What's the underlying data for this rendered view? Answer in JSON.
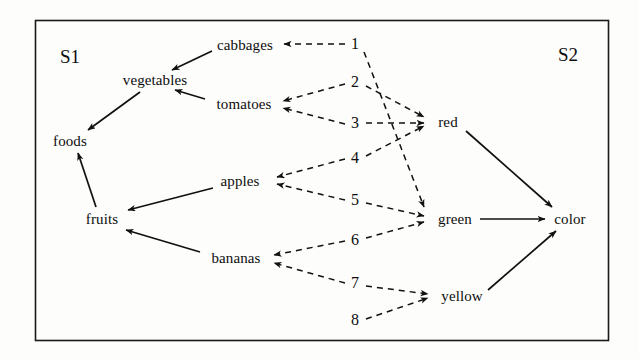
{
  "figure": {
    "type": "diagram",
    "kind": "bipartite-concept-lattice",
    "border_color": "#1a1a1a",
    "solid_edge_color": "#111111",
    "dashed_edge_color": "#111111",
    "background": "#fdfdfb"
  },
  "regions": {
    "left": {
      "label": "S1",
      "x": 70,
      "y": 57
    },
    "right": {
      "label": "S2",
      "x": 568,
      "y": 55
    }
  },
  "nodes": {
    "left_side": [
      {
        "id": "foods",
        "label": "foods",
        "x": 70,
        "y": 141
      },
      {
        "id": "vegetables",
        "label": "vegetables",
        "x": 155,
        "y": 80
      },
      {
        "id": "fruits",
        "label": "fruits",
        "x": 102,
        "y": 219
      },
      {
        "id": "cabbages",
        "label": "cabbages",
        "x": 245,
        "y": 45
      },
      {
        "id": "tomatoes",
        "label": "tomatoes",
        "x": 244,
        "y": 104
      },
      {
        "id": "apples",
        "label": "apples",
        "x": 240,
        "y": 181
      },
      {
        "id": "bananas",
        "label": "bananas",
        "x": 236,
        "y": 258
      }
    ],
    "middle_numbers": [
      {
        "id": "n1",
        "label": "1",
        "x": 355,
        "y": 44
      },
      {
        "id": "n2",
        "label": "2",
        "x": 355,
        "y": 82
      },
      {
        "id": "n3",
        "label": "3",
        "x": 355,
        "y": 123
      },
      {
        "id": "n4",
        "label": "4",
        "x": 355,
        "y": 158
      },
      {
        "id": "n5",
        "label": "5",
        "x": 355,
        "y": 200
      },
      {
        "id": "n6",
        "label": "6",
        "x": 355,
        "y": 240
      },
      {
        "id": "n7",
        "label": "7",
        "x": 355,
        "y": 283
      },
      {
        "id": "n8",
        "label": "8",
        "x": 355,
        "y": 320
      }
    ],
    "right_side": [
      {
        "id": "red",
        "label": "red",
        "x": 448,
        "y": 122
      },
      {
        "id": "green",
        "label": "green",
        "x": 455,
        "y": 219
      },
      {
        "id": "yellow",
        "label": "yellow",
        "x": 462,
        "y": 296
      },
      {
        "id": "color",
        "label": "color",
        "x": 570,
        "y": 219
      }
    ]
  },
  "edges": {
    "solid": [
      {
        "from": "cabbages",
        "to": "vegetables",
        "x1": 212,
        "y1": 51,
        "x2": 172,
        "y2": 70
      },
      {
        "from": "tomatoes",
        "to": "vegetables",
        "x1": 205,
        "y1": 99,
        "x2": 175,
        "y2": 90
      },
      {
        "from": "vegetables",
        "to": "foods",
        "x1": 140,
        "y1": 92,
        "x2": 88,
        "y2": 130
      },
      {
        "from": "fruits",
        "to": "foods",
        "x1": 96,
        "y1": 207,
        "x2": 78,
        "y2": 153
      },
      {
        "from": "apples",
        "to": "fruits",
        "x1": 213,
        "y1": 188,
        "x2": 128,
        "y2": 210
      },
      {
        "from": "bananas",
        "to": "fruits",
        "x1": 200,
        "y1": 252,
        "x2": 126,
        "y2": 230
      },
      {
        "from": "red",
        "to": "color",
        "x1": 466,
        "y1": 131,
        "x2": 552,
        "y2": 207
      },
      {
        "from": "green",
        "to": "color",
        "x1": 480,
        "y1": 219,
        "x2": 545,
        "y2": 219
      },
      {
        "from": "yellow",
        "to": "color",
        "x1": 488,
        "y1": 290,
        "x2": 556,
        "y2": 231
      }
    ],
    "dashed_left": [
      {
        "from": "n1",
        "to": "cabbages",
        "x1": 345,
        "y1": 44,
        "x2": 284,
        "y2": 44
      },
      {
        "from": "n2",
        "to": "tomatoes",
        "x1": 345,
        "y1": 84,
        "x2": 283,
        "y2": 101
      },
      {
        "from": "n3",
        "to": "tomatoes",
        "x1": 345,
        "y1": 124,
        "x2": 283,
        "y2": 108
      },
      {
        "from": "n4",
        "to": "apples",
        "x1": 345,
        "y1": 159,
        "x2": 277,
        "y2": 177
      },
      {
        "from": "n5",
        "to": "apples",
        "x1": 345,
        "y1": 200,
        "x2": 277,
        "y2": 184
      },
      {
        "from": "n6",
        "to": "bananas",
        "x1": 345,
        "y1": 241,
        "x2": 274,
        "y2": 255
      },
      {
        "from": "n7",
        "to": "bananas",
        "x1": 345,
        "y1": 283,
        "x2": 274,
        "y2": 263
      },
      {
        "from": "n8",
        "to": "yellow",
        "x1": 366,
        "y1": 319,
        "x2": 428,
        "y2": 298
      }
    ],
    "dashed_right": [
      {
        "from": "n1",
        "to": "green",
        "x1": 364,
        "y1": 52,
        "x2": 424,
        "y2": 207
      },
      {
        "from": "n2",
        "to": "red",
        "x1": 366,
        "y1": 86,
        "x2": 424,
        "y2": 117
      },
      {
        "from": "n3",
        "to": "red",
        "x1": 366,
        "y1": 123,
        "x2": 424,
        "y2": 123
      },
      {
        "from": "n4",
        "to": "red",
        "x1": 366,
        "y1": 156,
        "x2": 424,
        "y2": 126
      },
      {
        "from": "n5",
        "to": "green",
        "x1": 366,
        "y1": 203,
        "x2": 424,
        "y2": 216
      },
      {
        "from": "n6",
        "to": "green",
        "x1": 366,
        "y1": 238,
        "x2": 424,
        "y2": 222
      },
      {
        "from": "n7",
        "to": "yellow",
        "x1": 366,
        "y1": 286,
        "x2": 428,
        "y2": 294
      }
    ]
  },
  "frame": {
    "x": 35,
    "y": 20,
    "width": 573,
    "height": 320
  }
}
